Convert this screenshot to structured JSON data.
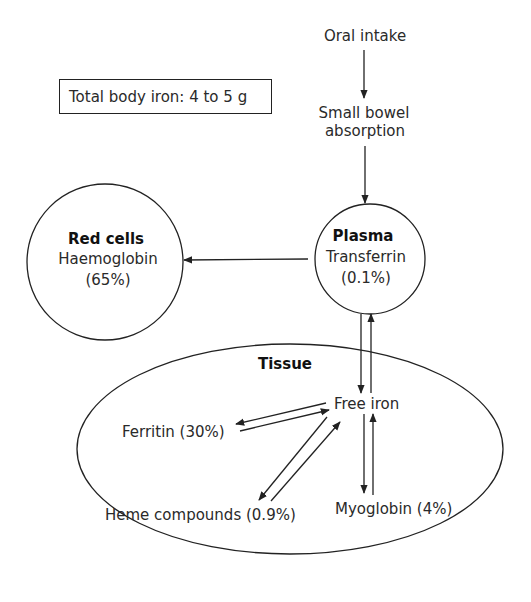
{
  "diagram": {
    "title_box": "Total body iron: 4 to 5 g",
    "nodes": {
      "oral_intake": "Oral intake",
      "small_bowel_line1": "Small bowel",
      "small_bowel_line2": "absorption",
      "red_cells": {
        "title": "Red cells",
        "subtitle": "Haemoglobin",
        "value": "(65%)"
      },
      "plasma": {
        "title": "Plasma",
        "subtitle": "Transferrin",
        "value": "(0.1%)"
      },
      "tissue": {
        "title": "Tissue"
      },
      "free_iron": "Free iron",
      "ferritin": "Ferritin (30%)",
      "heme": "Heme compounds (0.9%)",
      "myoglobin": "Myoglobin (4%)"
    },
    "edges": [
      {
        "from": "Oral intake",
        "to": "Small bowel absorption"
      },
      {
        "from": "Small bowel absorption",
        "to": "Plasma"
      },
      {
        "from": "Plasma",
        "to": "Red cells"
      },
      {
        "from": "Plasma",
        "to": "Free iron",
        "bidirectional": true
      },
      {
        "from": "Free iron",
        "to": "Ferritin",
        "bidirectional": true
      },
      {
        "from": "Free iron",
        "to": "Heme compounds",
        "bidirectional": true
      },
      {
        "from": "Free iron",
        "to": "Myoglobin",
        "bidirectional": true
      }
    ]
  }
}
